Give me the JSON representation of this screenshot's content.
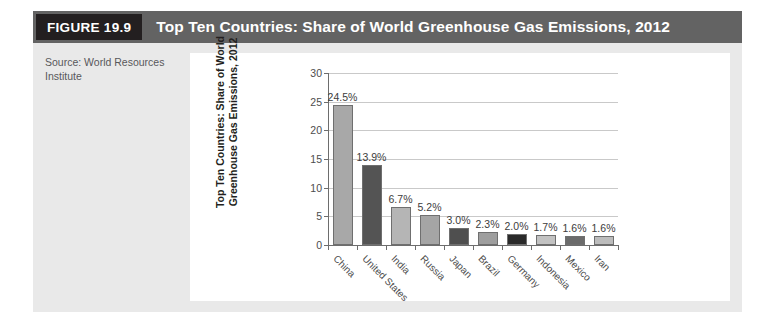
{
  "figure": {
    "number_label": "FIGURE 19.9",
    "title": "Top Ten Countries: Share of World Greenhouse Gas Emissions, 2012",
    "source_line_1": "Source: World Resources",
    "source_line_2": "Institute"
  },
  "colors": {
    "header_bar": "#636363",
    "figure_number_box": "#231f20",
    "figure_background": "#e9e9e9",
    "panel_background": "#ffffff",
    "gridline": "#c9c9c9",
    "axis": "#6d6d6d",
    "bar_border": "#6f6f6f"
  },
  "chart_data": {
    "type": "bar",
    "title": "Top Ten Countries: Share of World Greenhouse Gas Emissions, 2012",
    "xlabel": "",
    "ylabel_line_1": "Top Ten Countries: Share of World",
    "ylabel_line_2": "Greenhouse Gas Emissions, 2012",
    "ylim": [
      0,
      30
    ],
    "yticks": [
      0,
      5,
      10,
      15,
      20,
      25,
      30
    ],
    "ytick_labels": [
      "0",
      "5",
      "10",
      "15",
      "20",
      "25",
      "30"
    ],
    "grid": true,
    "legend": "none",
    "categories": [
      "China",
      "United States",
      "India",
      "Russia",
      "Japan",
      "Brazil",
      "Germany",
      "Indonesia",
      "Mexico",
      "Iran"
    ],
    "values": [
      24.5,
      13.9,
      6.7,
      5.2,
      3.0,
      2.3,
      2.0,
      1.7,
      1.6,
      1.6
    ],
    "data_labels": [
      "24.5%",
      "13.9%",
      "6.7%",
      "5.2%",
      "3.0%",
      "2.3%",
      "2.0%",
      "1.7%",
      "1.6%",
      "1.6%"
    ],
    "bar_colors": [
      "#a8a8a8",
      "#545454",
      "#b5b5b5",
      "#a5a5a5",
      "#4f4f4f",
      "#9e9e9e",
      "#2a2a2a",
      "#c2c2c2",
      "#6b6b6b",
      "#bcbcbc"
    ]
  }
}
